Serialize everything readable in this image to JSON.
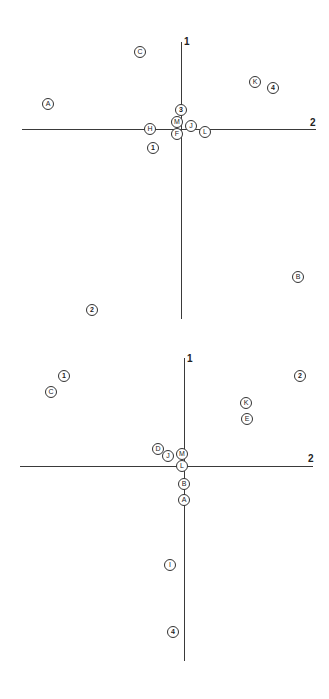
{
  "chart_data": [
    {
      "type": "scatter",
      "title": "",
      "xlabel": "2",
      "ylabel": "1",
      "axes": {
        "vertical_label": "1",
        "horizontal_label": "2",
        "grid": false,
        "legend": false
      },
      "points": [
        {
          "label": "C",
          "x": -0.3,
          "y": 0.88,
          "kind": "letter"
        },
        {
          "label": "A",
          "x": -0.97,
          "y": 0.29,
          "kind": "letter"
        },
        {
          "label": "K",
          "x": 0.53,
          "y": 0.54,
          "kind": "letter"
        },
        {
          "label": "4",
          "x": 0.66,
          "y": 0.47,
          "kind": "number"
        },
        {
          "label": "3",
          "x": 0.0,
          "y": 0.22,
          "kind": "number"
        },
        {
          "label": "M",
          "x": -0.03,
          "y": 0.08,
          "kind": "letter"
        },
        {
          "label": "J",
          "x": 0.07,
          "y": 0.05,
          "kind": "letter"
        },
        {
          "label": "H",
          "x": -0.22,
          "y": 0.0,
          "kind": "letter"
        },
        {
          "label": "F",
          "x": -0.03,
          "y": -0.05,
          "kind": "letter"
        },
        {
          "label": "L",
          "x": 0.17,
          "y": -0.02,
          "kind": "letter"
        },
        {
          "label": "1",
          "x": -0.2,
          "y": -0.22,
          "kind": "number"
        },
        {
          "label": "B",
          "x": 0.84,
          "y": -1.69,
          "kind": "letter"
        },
        {
          "label": "2",
          "x": -0.64,
          "y": -2.06,
          "kind": "number"
        }
      ]
    },
    {
      "type": "scatter",
      "title": "",
      "xlabel": "2",
      "ylabel": "1",
      "axes": {
        "vertical_label": "1",
        "horizontal_label": "2",
        "grid": false,
        "legend": false
      },
      "points": [
        {
          "label": "1",
          "x": -0.88,
          "y": 0.83,
          "kind": "number"
        },
        {
          "label": "C",
          "x": -0.97,
          "y": 0.69,
          "kind": "letter"
        },
        {
          "label": "2",
          "x": 0.92,
          "y": 0.84,
          "kind": "number"
        },
        {
          "label": "K",
          "x": 0.49,
          "y": 0.59,
          "kind": "letter"
        },
        {
          "label": "E",
          "x": 0.5,
          "y": 0.44,
          "kind": "letter"
        },
        {
          "label": "D",
          "x": -0.19,
          "y": 0.16,
          "kind": "letter"
        },
        {
          "label": "J",
          "x": -0.11,
          "y": 0.09,
          "kind": "letter"
        },
        {
          "label": "M",
          "x": -0.01,
          "y": 0.11,
          "kind": "letter"
        },
        {
          "label": "L",
          "x": -0.01,
          "y": 0.0,
          "kind": "letter"
        },
        {
          "label": "B",
          "x": 0.0,
          "y": -0.17,
          "kind": "letter"
        },
        {
          "label": "A",
          "x": 0.0,
          "y": -0.31,
          "kind": "letter"
        },
        {
          "label": "I",
          "x": -0.1,
          "y": -0.92,
          "kind": "letter"
        },
        {
          "label": "4",
          "x": -0.08,
          "y": -1.55,
          "kind": "number"
        }
      ]
    }
  ],
  "plots": [
    {
      "axis_v_label": "1",
      "axis_h_label": "2",
      "markers": [
        {
          "label": "C",
          "left": 140,
          "top": 52,
          "num": false
        },
        {
          "label": "A",
          "left": 48,
          "top": 104,
          "num": false
        },
        {
          "label": "K",
          "left": 255,
          "top": 82,
          "num": false
        },
        {
          "label": "4",
          "left": 273,
          "top": 88,
          "num": true
        },
        {
          "label": "3",
          "left": 181,
          "top": 110,
          "num": true
        },
        {
          "label": "M",
          "left": 177,
          "top": 122,
          "num": false
        },
        {
          "label": "J",
          "left": 191,
          "top": 126,
          "num": false
        },
        {
          "label": "H",
          "left": 150,
          "top": 129,
          "num": false
        },
        {
          "label": "F",
          "left": 177,
          "top": 134,
          "num": false
        },
        {
          "label": "L",
          "left": 205,
          "top": 132,
          "num": false
        },
        {
          "label": "1",
          "left": 153,
          "top": 148,
          "num": true
        },
        {
          "label": "B",
          "left": 298,
          "top": 277,
          "num": false
        },
        {
          "label": "2",
          "left": 92,
          "top": 310,
          "num": true
        }
      ]
    },
    {
      "axis_v_label": "1",
      "axis_h_label": "2",
      "markers": [
        {
          "label": "1",
          "left": 64,
          "top": 376,
          "num": true
        },
        {
          "label": "C",
          "left": 51,
          "top": 392,
          "num": false
        },
        {
          "label": "2",
          "left": 300,
          "top": 376,
          "num": true
        },
        {
          "label": "K",
          "left": 246,
          "top": 403,
          "num": false
        },
        {
          "label": "E",
          "left": 247,
          "top": 419,
          "num": false
        },
        {
          "label": "D",
          "left": 158,
          "top": 449,
          "num": false
        },
        {
          "label": "J",
          "left": 168,
          "top": 456,
          "num": false
        },
        {
          "label": "M",
          "left": 182,
          "top": 454,
          "num": false
        },
        {
          "label": "L",
          "left": 182,
          "top": 466,
          "num": false
        },
        {
          "label": "B",
          "left": 184,
          "top": 484,
          "num": false
        },
        {
          "label": "A",
          "left": 184,
          "top": 500,
          "num": false
        },
        {
          "label": "I",
          "left": 170,
          "top": 565,
          "num": false
        },
        {
          "label": "4",
          "left": 173,
          "top": 632,
          "num": true
        }
      ]
    }
  ]
}
